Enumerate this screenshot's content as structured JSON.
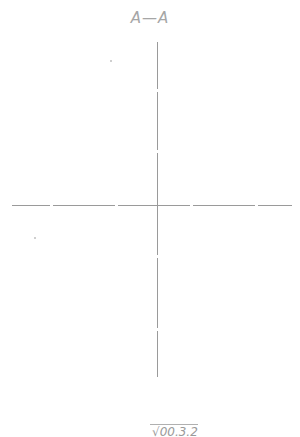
{
  "drawing": {
    "section_label": "A—A",
    "bottom_label": "√00.3.2",
    "line_color": "#9a9a9a",
    "text_color": "#a6a6a6"
  },
  "centerlines": {
    "horizontal": {
      "x1": 12,
      "x2": 292,
      "y": 205
    },
    "vertical": {
      "x": 157,
      "y1": 42,
      "y2": 377
    }
  }
}
